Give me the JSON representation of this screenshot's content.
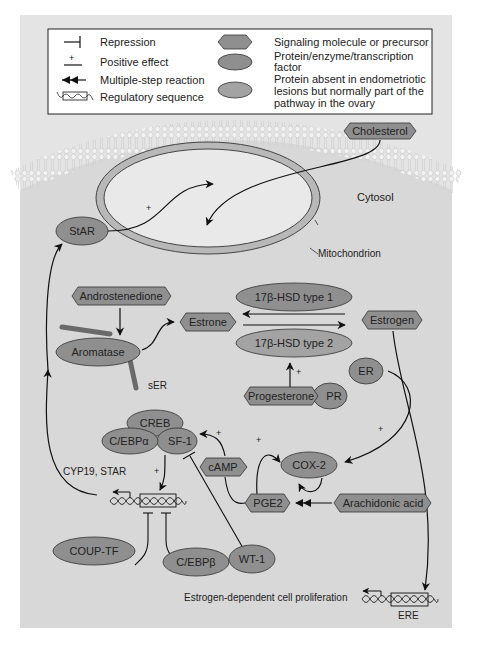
{
  "legend": {
    "items_left": [
      {
        "symbol": "repression-symbol",
        "label": "Repression"
      },
      {
        "symbol": "positive-effect-symbol",
        "label": "Positive effect"
      },
      {
        "symbol": "multiple-step-arrow-symbol",
        "label": "Multiple-step reaction"
      },
      {
        "symbol": "regulatory-sequence-symbol",
        "label": "Regulatory sequence"
      }
    ],
    "items_right": [
      {
        "symbol": "hexagon",
        "label_lines": [
          "Signaling molecule or precursor"
        ]
      },
      {
        "symbol": "ellipse-dark",
        "label_lines": [
          "Protein/enzyme/transcription",
          "factor"
        ]
      },
      {
        "symbol": "ellipse-light",
        "label_lines": [
          "Protein absent in endometriotic",
          "lesions but normally part of the",
          "pathway in the ovary"
        ]
      }
    ],
    "plus": "+"
  },
  "compartments": {
    "cytosol": "Cytosol",
    "mitochondrion": "Mitochondrion",
    "ser": "sER"
  },
  "molecules": {
    "cholesterol": "Cholesterol",
    "androstenedione": "Androstenedione",
    "estrone": "Estrone",
    "estrogen": "Estrogen",
    "progesterone": "Progesterone",
    "camp": "cAMP",
    "pge2": "PGE2",
    "arachidonic_acid": "Arachidonic acid"
  },
  "proteins": {
    "star": "StAR",
    "aromatase": "Aromatase",
    "hsd1": "17β-HSD type 1",
    "hsd2": "17β-HSD type 2",
    "pr": "PR",
    "er": "ER",
    "creb": "CREB",
    "cebpa": "C/EBPα",
    "sf1": "SF-1",
    "cox2": "COX-2",
    "coup_tf": "COUP-TF",
    "cebpb": "C/EBPβ",
    "wt1": "WT-1"
  },
  "labels": {
    "cyp19_star": "CYP19, STAR",
    "proliferation": "Estrogen-dependent cell proliferation",
    "ere": "ERE",
    "plus": "+"
  },
  "colors": {
    "panel_bg": "#e4e4e4",
    "cytosol_bg": "#d9d9d9",
    "node_dark": "#8f8f8f",
    "node_light": "#a6a6a6",
    "outline": "#333333"
  }
}
